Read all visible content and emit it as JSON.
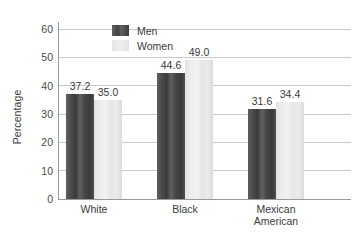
{
  "chart_data": {
    "type": "bar",
    "title": "",
    "subtitle": "",
    "xlabel": "",
    "ylabel": "Percentage",
    "categories": [
      "White",
      "Black",
      "Mexican American"
    ],
    "category_lines": [
      [
        "White"
      ],
      [
        "Black"
      ],
      [
        "Mexican",
        "American"
      ]
    ],
    "series": [
      {
        "name": "Men",
        "values": [
          37.2,
          44.6,
          31.6
        ],
        "color": "#4a4a4a"
      },
      {
        "name": "Women",
        "values": [
          35.0,
          49.0,
          34.4
        ],
        "color": "#e8e8e8"
      }
    ],
    "value_labels": [
      [
        "37.2",
        "35.0"
      ],
      [
        "44.6",
        "49.0"
      ],
      [
        "31.6",
        "34.4"
      ]
    ],
    "ylim": [
      0,
      60
    ],
    "ytick_values": [
      0,
      10,
      20,
      30,
      40,
      50,
      60
    ],
    "ytick_labels": [
      "0",
      "10",
      "20",
      "30",
      "40",
      "50",
      "60"
    ],
    "grid": true,
    "grid_axis": "y",
    "legend_position": "top-left-inside",
    "legend_entries": [
      "Men",
      "Women"
    ]
  },
  "axis": {
    "y_title": "Percentage"
  },
  "legend": {
    "men_label": "Men",
    "women_label": "Women"
  }
}
